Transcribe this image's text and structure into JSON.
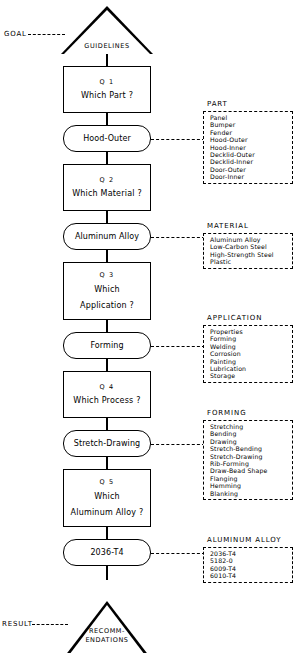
{
  "diagram": {
    "terminals": {
      "goal_caption": "GOAL",
      "goal_node": "GUIDELINES",
      "result_caption": "RESULT",
      "result_node_line1": "RECOMM-",
      "result_node_line2": "ENDATIONS"
    },
    "steps": [
      {
        "question_id": "Q 1",
        "question_line1": "Which Part ?",
        "question_line2": "",
        "answer": "Hood-Outer",
        "panel_title": "PART",
        "options": [
          "Panel",
          "Bumper",
          "Fender",
          "Hood-Outer",
          "Hood-Inner",
          "Decklid-Outer",
          "Decklid-Inner",
          "Door-Outer",
          "Door-Inner"
        ]
      },
      {
        "question_id": "Q 2",
        "question_line1": "Which Material ?",
        "question_line2": "",
        "answer": "Aluminum Alloy",
        "panel_title": "MATERIAL",
        "options": [
          "Aluminum Alloy",
          "Low-Carbon Steel",
          "High-Strength Steel",
          "Plastic"
        ]
      },
      {
        "question_id": "Q 3",
        "question_line1": "Which",
        "question_line2": "Application ?",
        "answer": "Forming",
        "panel_title": "APPLICATION",
        "options": [
          "Properties",
          "Forming",
          "Welding",
          "Corrosion",
          "Painting",
          "Lubrication",
          "Storage"
        ]
      },
      {
        "question_id": "Q 4",
        "question_line1": "Which Process ?",
        "question_line2": "",
        "answer": "Stretch-Drawing",
        "panel_title": "FORMING",
        "options": [
          "Stretching",
          "Bending",
          "Drawing",
          "Stretch-Bending",
          "Stretch-Drawing",
          "Rib-Forming",
          "Draw-Bead Shape",
          "Flanging",
          "Hemming",
          "Blanking"
        ]
      },
      {
        "question_id": "Q 5",
        "question_line1": "Which",
        "question_line2": "Aluminum Alloy ?",
        "answer": "2036-T4",
        "panel_title": "ALUMINUM ALLOY",
        "options": [
          "2036-T4",
          "5182-0",
          "6009-T4",
          "6010-T4"
        ]
      }
    ]
  }
}
